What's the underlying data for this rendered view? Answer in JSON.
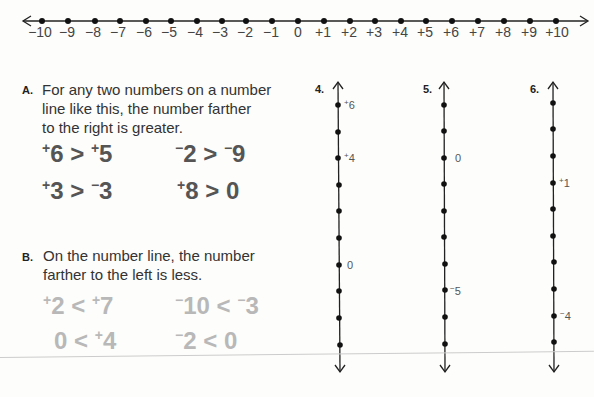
{
  "number_line": {
    "ticks": [
      "−10",
      "−9",
      "−8",
      "−7",
      "−6",
      "−5",
      "−4",
      "−3",
      "−2",
      "−1",
      "0",
      "+1",
      "+2",
      "+3",
      "+4",
      "+5",
      "+6",
      "+7",
      "+8",
      "+9",
      "+10"
    ]
  },
  "section_a": {
    "letter": "A.",
    "text_lines": [
      "For any two numbers on a number",
      "line like this, the number farther",
      "to the right is greater."
    ],
    "inequalities": [
      {
        "left_sign": "+",
        "left": "6",
        "op": ">",
        "right_sign": "+",
        "right": "5"
      },
      {
        "left_sign": "−",
        "left": "2",
        "op": ">",
        "right_sign": "−",
        "right": "9"
      },
      {
        "left_sign": "+",
        "left": "3",
        "op": ">",
        "right_sign": "−",
        "right": "3"
      },
      {
        "left_sign": "+",
        "left": "8",
        "op": ">",
        "right_sign": "",
        "right": "0"
      }
    ]
  },
  "section_b": {
    "letter": "B.",
    "text_lines": [
      "On the number line, the number",
      "farther to the left is less."
    ],
    "inequalities": [
      {
        "left_sign": "+",
        "left": "2",
        "op": "<",
        "right_sign": "+",
        "right": "7"
      },
      {
        "left_sign": "−",
        "left": "10",
        "op": "<",
        "right_sign": "−",
        "right": "3"
      },
      {
        "left_sign": "",
        "left": "0",
        "op": "<",
        "right_sign": "+",
        "right": "4"
      },
      {
        "left_sign": "−",
        "left": "2",
        "op": "<",
        "right_sign": "",
        "right": "0"
      }
    ]
  },
  "exercises": [
    {
      "number": "4.",
      "labels": [
        {
          "sign": "+",
          "value": "6"
        },
        {
          "sign": "+",
          "value": "4"
        },
        {
          "sign": "",
          "value": "0"
        }
      ]
    },
    {
      "number": "5.",
      "labels": [
        {
          "sign": "",
          "value": "0"
        },
        {
          "sign": "−",
          "value": "5"
        }
      ]
    },
    {
      "number": "6.",
      "labels": [
        {
          "sign": "+",
          "value": "1"
        },
        {
          "sign": "−",
          "value": "4"
        }
      ]
    }
  ]
}
